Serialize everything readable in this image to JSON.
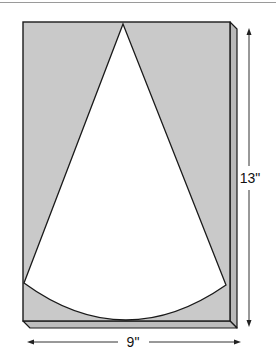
{
  "diagram": {
    "type": "cone-pattern-on-board",
    "colors": {
      "board_front": "#c9c9c9",
      "board_side": "#b9b9b9",
      "board_bottom": "#bdbdbd",
      "sector_fill": "#ffffff",
      "outline": "#1a1a1a",
      "dimension_line": "#333333",
      "top_rule": "#9a9a9a"
    },
    "dimensions": {
      "width_label": "9\"",
      "height_label": "13\""
    },
    "board": {
      "front": {
        "x": 23,
        "y": 22,
        "w": 207,
        "h": 299
      },
      "depth_offset": {
        "dx": 7,
        "dy": 7
      }
    },
    "sector": {
      "apex": [
        123,
        24
      ],
      "left_end": [
        24,
        283
      ],
      "right_end": [
        226,
        285
      ],
      "arc_bottom": [
        125,
        320
      ]
    }
  }
}
